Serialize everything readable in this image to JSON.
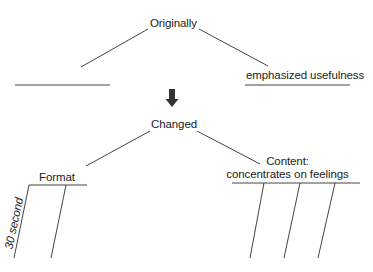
{
  "diagram": {
    "type": "fishbone-like tree / frame diagram",
    "colors": {
      "line": "#444444",
      "text": "#222222",
      "arrow": "#333333",
      "background": "#ffffff"
    },
    "top_node": {
      "label": "Originally",
      "branches": [
        {
          "label": ""
        },
        {
          "label": "emphasized usefulness"
        }
      ]
    },
    "arrow": {
      "icon": "down-arrow-icon",
      "direction": "down"
    },
    "bottom_node": {
      "label": "Changed",
      "branches": [
        {
          "label": "Format",
          "sub_lines": [
            {
              "label": "30 second"
            },
            {
              "label": ""
            }
          ]
        },
        {
          "label_line1": "Content:",
          "label_line2": "concentrates on feelings",
          "sub_lines": [
            {
              "label": ""
            },
            {
              "label": ""
            },
            {
              "label": ""
            }
          ]
        }
      ]
    }
  }
}
